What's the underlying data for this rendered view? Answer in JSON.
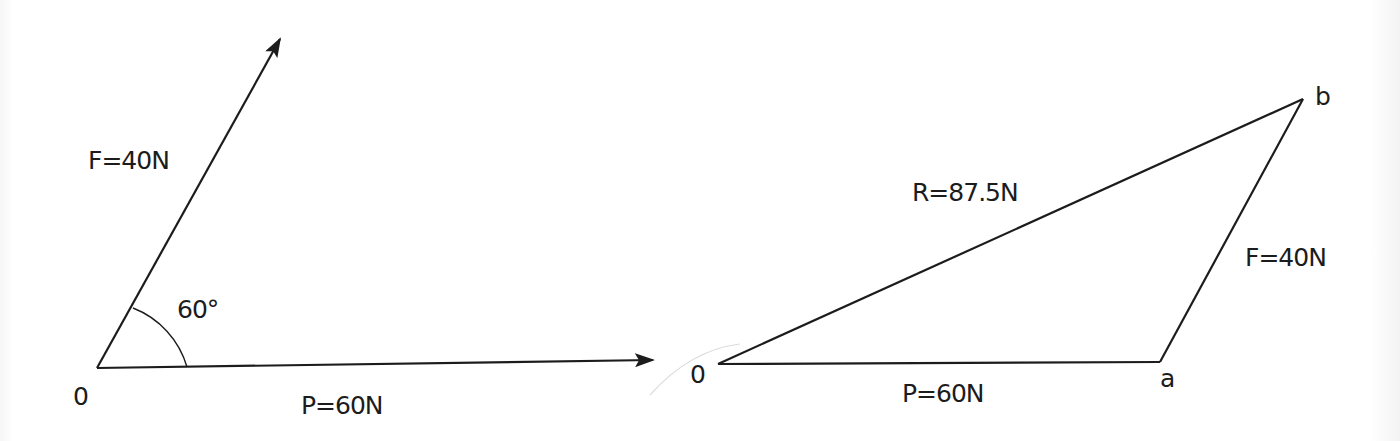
{
  "figure": {
    "left_diagram": {
      "title": "Force vectors from origin",
      "origin_label": "0",
      "force_f_label": "F=40N",
      "force_p_label": "P=60N",
      "angle_label": "60°"
    },
    "right_diagram": {
      "title": "Triangle of forces",
      "origin_label": "0",
      "point_a_label": "a",
      "point_b_label": "b",
      "side_p_label": "P=60N",
      "side_f_label": "F=40N",
      "resultant_label": "R=87.5N"
    }
  },
  "colors": {
    "ink": "#1c1c1c",
    "background": "#ffffff",
    "faint_curve": "#d8d8d8"
  }
}
